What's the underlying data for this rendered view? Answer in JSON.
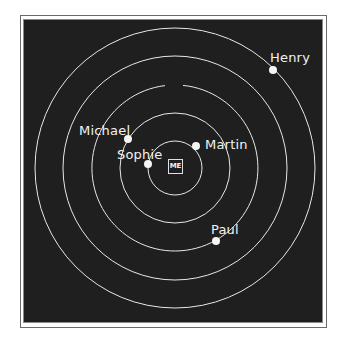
{
  "diagram": {
    "type": "concentric-circles-relationship",
    "center_label": "ME",
    "center": {
      "x": 175,
      "y": 168
    },
    "ring_radii": [
      27,
      55,
      83,
      112,
      140
    ],
    "colors": {
      "background": "#1f1f1f",
      "lines": "#e8e8e8",
      "frame": "#ffffff"
    },
    "people": [
      {
        "name": "Sophie",
        "ring": 1,
        "dot": {
          "x": 148,
          "y": 164
        }
      },
      {
        "name": "Martin",
        "ring": 1,
        "dot": {
          "x": 196,
          "y": 146
        }
      },
      {
        "name": "Michael",
        "ring": 2,
        "dot": {
          "x": 128,
          "y": 139
        }
      },
      {
        "name": "Paul",
        "ring": 3,
        "dot": {
          "x": 216,
          "y": 241
        }
      },
      {
        "name": "Henry",
        "ring": 5,
        "dot": {
          "x": 273,
          "y": 70
        }
      }
    ]
  }
}
